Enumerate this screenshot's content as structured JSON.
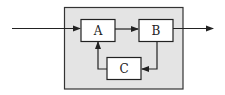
{
  "diagram": {
    "type": "block-diagram",
    "container": {
      "fill": "#e4e4e4",
      "stroke": "#333333",
      "x": 64,
      "y": 7,
      "w": 119,
      "h": 82
    },
    "blocks": [
      {
        "id": "A",
        "label": "A",
        "x": 81,
        "y": 19,
        "w": 34,
        "h": 22
      },
      {
        "id": "B",
        "label": "B",
        "x": 139,
        "y": 19,
        "w": 34,
        "h": 22
      },
      {
        "id": "C",
        "label": "C",
        "x": 107,
        "y": 57,
        "w": 34,
        "h": 22
      }
    ],
    "connections": [
      {
        "from": "input",
        "to": "A",
        "label": ""
      },
      {
        "from": "A",
        "to": "B",
        "label": ""
      },
      {
        "from": "B",
        "to": "C",
        "label": ""
      },
      {
        "from": "C",
        "to": "A",
        "label": ""
      },
      {
        "from": "B",
        "to": "output",
        "label": ""
      }
    ],
    "colors": {
      "line": "#222222",
      "block_fill": "#ffffff",
      "container_fill": "#e4e4e4"
    }
  }
}
